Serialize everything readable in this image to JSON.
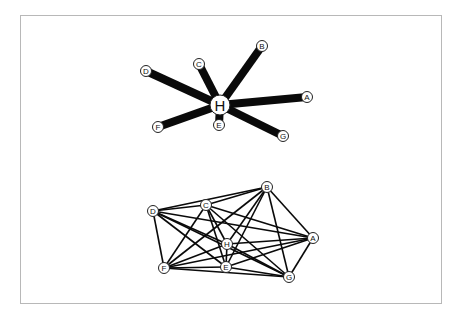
{
  "figure": {
    "width": 461,
    "height": 322,
    "frame": {
      "x": 20,
      "y": 15,
      "width": 421,
      "height": 288,
      "stroke": "#b8b8b8"
    },
    "colors": {
      "edge": "#0a0a0a",
      "node_fill": "#ffffff",
      "node_stroke": "#222222",
      "label": "#111111"
    }
  },
  "graphs": [
    {
      "name": "star-graph",
      "description": "Star network centered on H with heavy weighted edges",
      "edge_width": 8,
      "nodes": [
        {
          "id": "H",
          "label": "H",
          "x": 220,
          "y": 105,
          "r": 10,
          "font_size": 15
        },
        {
          "id": "A",
          "label": "A",
          "x": 307,
          "y": 97,
          "r": 5.5,
          "font_size": 8
        },
        {
          "id": "B",
          "label": "B",
          "x": 262,
          "y": 46,
          "r": 5.5,
          "font_size": 8
        },
        {
          "id": "C",
          "label": "C",
          "x": 199,
          "y": 64,
          "r": 5.5,
          "font_size": 8
        },
        {
          "id": "D",
          "label": "D",
          "x": 146,
          "y": 71,
          "r": 5.5,
          "font_size": 8
        },
        {
          "id": "E",
          "label": "E",
          "x": 219,
          "y": 125,
          "r": 5.5,
          "font_size": 8
        },
        {
          "id": "F",
          "label": "F",
          "x": 158,
          "y": 127,
          "r": 5.5,
          "font_size": 8
        },
        {
          "id": "G",
          "label": "G",
          "x": 283,
          "y": 136,
          "r": 5.5,
          "font_size": 8
        }
      ],
      "edges": [
        [
          "H",
          "A"
        ],
        [
          "H",
          "B"
        ],
        [
          "H",
          "C"
        ],
        [
          "H",
          "D"
        ],
        [
          "H",
          "E"
        ],
        [
          "H",
          "F"
        ],
        [
          "H",
          "G"
        ]
      ]
    },
    {
      "name": "complete-graph",
      "description": "Dense fully connected network of the same eight nodes",
      "edge_width": 1.6,
      "nodes": [
        {
          "id": "A",
          "label": "A",
          "x": 313,
          "y": 238,
          "r": 5.5,
          "font_size": 8
        },
        {
          "id": "B",
          "label": "B",
          "x": 267,
          "y": 187,
          "r": 5.5,
          "font_size": 8
        },
        {
          "id": "C",
          "label": "C",
          "x": 206,
          "y": 205,
          "r": 5.5,
          "font_size": 8
        },
        {
          "id": "D",
          "label": "D",
          "x": 153,
          "y": 211,
          "r": 5.5,
          "font_size": 8
        },
        {
          "id": "E",
          "label": "E",
          "x": 226,
          "y": 267,
          "r": 5.5,
          "font_size": 8
        },
        {
          "id": "F",
          "label": "F",
          "x": 164,
          "y": 268,
          "r": 5.5,
          "font_size": 8
        },
        {
          "id": "G",
          "label": "G",
          "x": 289,
          "y": 277,
          "r": 5.5,
          "font_size": 8
        },
        {
          "id": "H",
          "label": "H",
          "x": 227,
          "y": 244,
          "r": 5.5,
          "font_size": 8
        }
      ],
      "edges": [
        [
          "A",
          "B"
        ],
        [
          "A",
          "C"
        ],
        [
          "A",
          "D"
        ],
        [
          "A",
          "E"
        ],
        [
          "A",
          "F"
        ],
        [
          "A",
          "G"
        ],
        [
          "A",
          "H"
        ],
        [
          "B",
          "C"
        ],
        [
          "B",
          "D"
        ],
        [
          "B",
          "E"
        ],
        [
          "B",
          "F"
        ],
        [
          "B",
          "G"
        ],
        [
          "B",
          "H"
        ],
        [
          "C",
          "D"
        ],
        [
          "C",
          "E"
        ],
        [
          "C",
          "F"
        ],
        [
          "C",
          "G"
        ],
        [
          "C",
          "H"
        ],
        [
          "D",
          "E"
        ],
        [
          "D",
          "F"
        ],
        [
          "D",
          "G"
        ],
        [
          "D",
          "H"
        ],
        [
          "E",
          "F"
        ],
        [
          "E",
          "G"
        ],
        [
          "E",
          "H"
        ],
        [
          "F",
          "G"
        ],
        [
          "F",
          "H"
        ],
        [
          "G",
          "H"
        ]
      ]
    }
  ]
}
